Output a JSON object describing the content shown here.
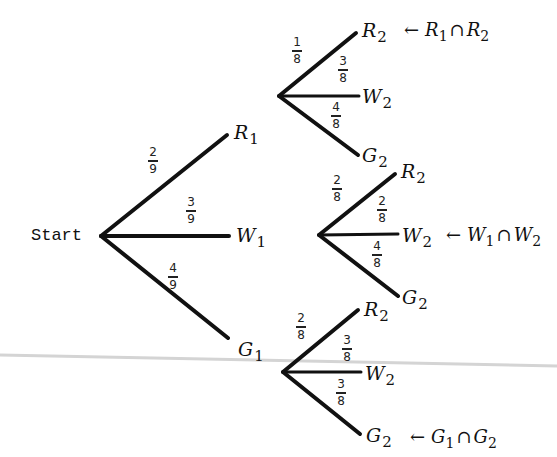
{
  "diagram": {
    "type": "probability-tree",
    "root": {
      "label": "Start",
      "x": 101,
      "y": 236
    },
    "first_stage": [
      {
        "event": "R",
        "stage": "1",
        "prob_num": "2",
        "prob_den": "9",
        "end": [
          227,
          135
        ],
        "label_pos": [
          234,
          123
        ],
        "frac_pos": [
          148,
          146
        ]
      },
      {
        "event": "W",
        "stage": "1",
        "prob_num": "3",
        "prob_den": "9",
        "end": [
          229,
          236
        ],
        "label_pos": [
          236,
          226
        ],
        "frac_pos": [
          186,
          196
        ]
      },
      {
        "event": "G",
        "stage": "1",
        "prob_num": "4",
        "prob_den": "9",
        "end": [
          228,
          338
        ],
        "label_pos": [
          238,
          340
        ],
        "frac_pos": [
          168,
          262
        ]
      }
    ],
    "second_stage": [
      {
        "parent": "R1",
        "node": [
          279,
          96
        ],
        "branches": [
          {
            "event": "R",
            "stage": "2",
            "prob_num": "1",
            "prob_den": "8",
            "end": [
              356,
              33
            ],
            "label_pos": [
              362,
              21
            ],
            "frac_pos": [
              292,
              36
            ],
            "annotation": {
              "arrow": "←",
              "a": "R",
              "a_sub": "1",
              "op": "∩",
              "b": "R",
              "b_sub": "2",
              "pos": [
                404,
                21
              ]
            }
          },
          {
            "event": "W",
            "stage": "2",
            "prob_num": "3",
            "prob_den": "8",
            "end": [
              359,
              96
            ],
            "label_pos": [
              362,
              87
            ],
            "frac_pos": [
              338,
              55
            ]
          },
          {
            "event": "G",
            "stage": "2",
            "prob_num": "4",
            "prob_den": "8",
            "end": [
              358,
              155
            ],
            "label_pos": [
              362,
              146
            ],
            "frac_pos": [
              331,
              101
            ]
          }
        ]
      },
      {
        "parent": "W1",
        "node": [
          319,
          235
        ],
        "branches": [
          {
            "event": "R",
            "stage": "2",
            "prob_num": "2",
            "prob_den": "8",
            "end": [
              395,
              174
            ],
            "label_pos": [
              401,
              162
            ],
            "frac_pos": [
              332,
              174
            ]
          },
          {
            "event": "W",
            "stage": "2",
            "prob_num": "2",
            "prob_den": "8",
            "end": [
              398,
              234
            ],
            "label_pos": [
              402,
              226
            ],
            "frac_pos": [
              377,
              195
            ]
          },
          {
            "event": "G",
            "stage": "2",
            "prob_num": "4",
            "prob_den": "8",
            "end": [
              398,
              296
            ],
            "label_pos": [
              402,
              288
            ],
            "frac_pos": [
              372,
              240
            ]
          }
        ],
        "annotation_index": 1,
        "annotation": {
          "arrow": "←",
          "a": "W",
          "a_sub": "1",
          "op": "∩",
          "b": "W",
          "b_sub": "2",
          "pos": [
            446,
            226
          ]
        }
      },
      {
        "parent": "G1",
        "node": [
          283,
          372
        ],
        "branches": [
          {
            "event": "R",
            "stage": "2",
            "prob_num": "2",
            "prob_den": "8",
            "end": [
              358,
              310
            ],
            "label_pos": [
              364,
              300
            ],
            "frac_pos": [
              296,
              312
            ]
          },
          {
            "event": "W",
            "stage": "2",
            "prob_num": "3",
            "prob_den": "8",
            "end": [
              361,
              372
            ],
            "label_pos": [
              365,
              364
            ],
            "frac_pos": [
              342,
              334
            ]
          },
          {
            "event": "G",
            "stage": "2",
            "prob_num": "3",
            "prob_den": "8",
            "end": [
              360,
              434
            ],
            "label_pos": [
              366,
              426
            ],
            "frac_pos": [
              336,
              378
            ]
          }
        ],
        "annotation_index": 2,
        "annotation": {
          "arrow": "←",
          "a": "G",
          "a_sub": "1",
          "op": "∩",
          "b": "G",
          "b_sub": "2",
          "pos": [
            410,
            428
          ]
        }
      }
    ],
    "scan_line": {
      "x1": 0,
      "y1": 355,
      "x2": 557,
      "y2": 366,
      "color": "#d4d4d4"
    }
  }
}
